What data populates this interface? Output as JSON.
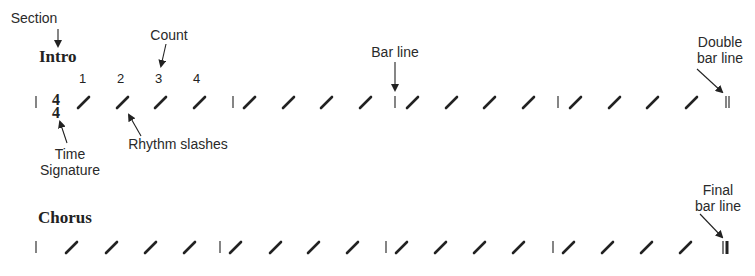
{
  "annotations": {
    "section": "Section",
    "count": "Count",
    "bar_line": "Bar line",
    "double_bar_line_1": "Double",
    "double_bar_line_2": "bar line",
    "time_signature_1": "Time",
    "time_signature_2": "Signature",
    "rhythm_slashes": "Rhythm slashes",
    "final_bar_line_1": "Final",
    "final_bar_line_2": "bar line"
  },
  "sections": [
    {
      "name": "Intro",
      "time_signature": {
        "top": "4",
        "bottom": "4"
      },
      "counts": [
        "1",
        "2",
        "3",
        "4"
      ],
      "measures": 4,
      "beats_per_measure": 4,
      "end_bar": "double"
    },
    {
      "name": "Chorus",
      "measures": 4,
      "beats_per_measure": 4,
      "end_bar": "final"
    }
  ],
  "colors": {
    "ink": "#222222",
    "background": "#ffffff"
  }
}
